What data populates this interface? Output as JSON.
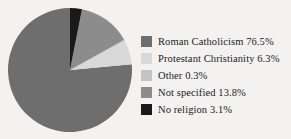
{
  "chart_data": {
    "type": "pie",
    "title": "",
    "labels": [
      "Roman Catholicism",
      "Protestant Christianity",
      "Other",
      "Not specified",
      "No religion"
    ],
    "values": [
      76.5,
      6.3,
      0.3,
      13.8,
      3.1
    ],
    "value_suffix": "%",
    "colors": [
      "#6e6e6e",
      "#d9d9d9",
      "#c4c4c4",
      "#8c8c8c",
      "#1a1a1a"
    ],
    "legend_position": "right",
    "grid": false,
    "start_angle_deg": 0,
    "direction": "counterclockwise"
  },
  "legend": {
    "items": [
      {
        "label": "Roman Catholicism 76.5%",
        "color": "#6e6e6e",
        "swatch_name": "legend-swatch-roman-catholicism"
      },
      {
        "label": "Protestant Christianity 6.3%",
        "color": "#d9d9d9",
        "swatch_name": "legend-swatch-protestant-christianity"
      },
      {
        "label": "Other 0.3%",
        "color": "#c4c4c4",
        "swatch_name": "legend-swatch-other"
      },
      {
        "label": "Not specified 13.8%",
        "color": "#8c8c8c",
        "swatch_name": "legend-swatch-not-specified"
      },
      {
        "label": "No religion 3.1%",
        "color": "#1a1a1a",
        "swatch_name": "legend-swatch-no-religion"
      }
    ]
  },
  "page": {
    "background": "#f3f2f0",
    "text_color": "#1b1b1b"
  }
}
